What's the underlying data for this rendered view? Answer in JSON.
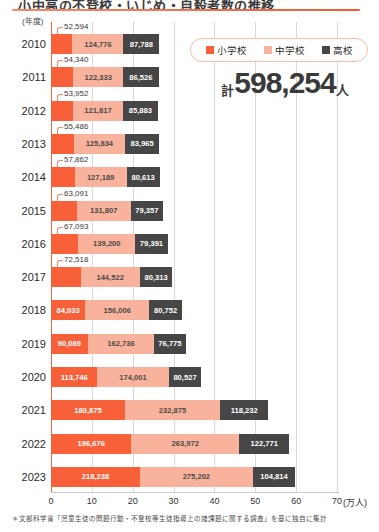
{
  "header": {
    "title": "小中高の不登校・いじめ・自殺者数の推移",
    "axis_unit_label": "(年度)"
  },
  "legend": {
    "items": [
      {
        "label": "小学校",
        "color": "#f8603a",
        "icon": "square-swatch"
      },
      {
        "label": "中学校",
        "color": "#f9b29c",
        "icon": "square-swatch"
      },
      {
        "label": "高校",
        "color": "#464646",
        "icon": "square-swatch"
      }
    ]
  },
  "total": {
    "prefix": "計",
    "value": "598,254",
    "suffix": "人"
  },
  "footnote": "＊文部科学省「児童生徒の問題行動・不登校等生徒指導上の諸課題に関する調査」を基に独自に集計",
  "chart_data": {
    "type": "bar",
    "orientation": "horizontal",
    "stacked": true,
    "title": "小中高の不登校・いじめ・自殺者数の推移",
    "xlabel": "(万人)",
    "ylabel": "(年度)",
    "xlim": [
      0,
      700000
    ],
    "xticks": [
      0,
      10,
      20,
      30,
      40,
      50,
      60,
      70
    ],
    "xtick_labels": [
      "0",
      "10",
      "20",
      "30",
      "40",
      "50",
      "60",
      "70"
    ],
    "xtick_unit": "(万人)",
    "grid": true,
    "legend_position": "top-right",
    "categories": [
      "2010",
      "2011",
      "2012",
      "2013",
      "2014",
      "2015",
      "2016",
      "2017",
      "2018",
      "2019",
      "2020",
      "2021",
      "2022",
      "2023"
    ],
    "series": [
      {
        "name": "小学校",
        "color": "#f8603a",
        "values": [
          52594,
          54340,
          53952,
          55486,
          57862,
          63091,
          67093,
          72518,
          84033,
          90089,
          113746,
          180875,
          196676,
          218238
        ],
        "labels": [
          "52,594",
          "54,340",
          "53,952",
          "55,486",
          "57,862",
          "63,091",
          "67,093",
          "72,518",
          "84,033",
          "90,089",
          "113,746",
          "180,875",
          "196,676",
          "218,238"
        ]
      },
      {
        "name": "中学校",
        "color": "#f9b29c",
        "values": [
          124776,
          122333,
          121817,
          125834,
          127189,
          131807,
          139200,
          144522,
          156006,
          162736,
          174001,
          232875,
          263972,
          275202
        ],
        "labels": [
          "124,776",
          "122,333",
          "121,817",
          "125,834",
          "127,189",
          "131,807",
          "139,200",
          "144,522",
          "156,006",
          "162,736",
          "174,001",
          "232,875",
          "263,972",
          "275,202"
        ]
      },
      {
        "name": "高校",
        "color": "#464646",
        "values": [
          87788,
          86526,
          85883,
          83965,
          80613,
          79357,
          79391,
          80313,
          80752,
          76775,
          80527,
          118232,
          122771,
          104814
        ],
        "labels": [
          "87,788",
          "86,526",
          "85,883",
          "83,965",
          "80,613",
          "79,357",
          "79,391",
          "80,313",
          "80,752",
          "76,775",
          "80,527",
          "118,232",
          "122,771",
          "104,814"
        ]
      }
    ],
    "callout_years": [
      "2010",
      "2011",
      "2012",
      "2013",
      "2014",
      "2015",
      "2016",
      "2017"
    ],
    "note": "小学校の値が細いため2010〜2017年度は引き出し線で表示"
  }
}
